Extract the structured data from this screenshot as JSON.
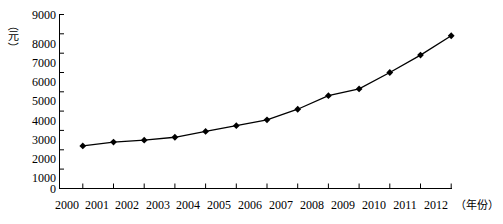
{
  "chart_data": {
    "type": "line",
    "title": "",
    "subtitle": "",
    "xlabel": "（年份）",
    "ylabel": "（元）",
    "categories": [
      "2000",
      "2001",
      "2002",
      "2003",
      "2004",
      "2005",
      "2006",
      "2007",
      "2008",
      "2009",
      "2010",
      "2011",
      "2012"
    ],
    "values": [
      2200,
      2400,
      2500,
      2650,
      2950,
      3250,
      3550,
      4100,
      4800,
      5150,
      6000,
      6900,
      7900
    ],
    "series": [
      {
        "name": "",
        "values": [
          2200,
          2400,
          2500,
          2650,
          2950,
          3250,
          3550,
          4100,
          4800,
          5150,
          6000,
          6900,
          7900
        ]
      }
    ],
    "ylim": [
      0,
      9000
    ],
    "yticks": [
      0,
      1000,
      2000,
      3000,
      4000,
      5000,
      6000,
      7000,
      8000,
      9000
    ],
    "ytick_labels": [
      "0",
      "1000",
      "2000",
      "3000",
      "4000",
      "5000",
      "6000",
      "7000",
      "8000",
      "9000"
    ],
    "xtick_labels": [
      "2000",
      "2001",
      "2002",
      "2003",
      "2004",
      "2005",
      "2006",
      "2007",
      "2008",
      "2009",
      "2010",
      "2011",
      "2012"
    ],
    "grid": false,
    "legend": "none",
    "marker": "diamond",
    "line_color": "#000000",
    "marker_color": "#000000",
    "background_color": "#ffffff",
    "axis_color": "#000000"
  },
  "axis": {
    "y_unit_open_paren": "（",
    "y_unit_char": "元",
    "y_unit_close_paren": "）",
    "x_axis_caption": "（年份）"
  }
}
